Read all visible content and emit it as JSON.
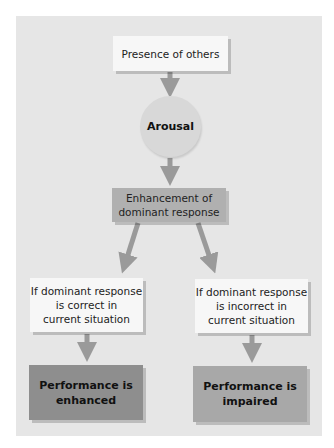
{
  "diagram": {
    "colors": {
      "panel_bg": "#e6e6e6",
      "arrow": "#9a9a9a",
      "light_box": "#f7f7f7",
      "circle": "#d8d8d8",
      "mid_box": "#b0b0b0",
      "result_enhanced": "#8e8e8e",
      "result_impaired": "#a8a8a8"
    },
    "nodes": {
      "presence": {
        "label": "Presence of others"
      },
      "arousal": {
        "label": "Arousal"
      },
      "enhancement": {
        "line1": "Enhancement of",
        "line2": "dominant response"
      },
      "condition_correct": {
        "line1": "If dominant response",
        "line2": "is correct in",
        "line3": "current situation"
      },
      "condition_incorrect": {
        "line1": "If dominant response",
        "line2": "is incorrect in",
        "line3": "current situation"
      },
      "result_enhanced": {
        "line1": "Performance is",
        "line2": "enhanced"
      },
      "result_impaired": {
        "line1": "Performance is",
        "line2": "impaired"
      }
    },
    "edges": [
      {
        "from": "presence",
        "to": "arousal"
      },
      {
        "from": "arousal",
        "to": "enhancement"
      },
      {
        "from": "enhancement",
        "to": "condition_correct"
      },
      {
        "from": "enhancement",
        "to": "condition_incorrect"
      },
      {
        "from": "condition_correct",
        "to": "result_enhanced"
      },
      {
        "from": "condition_incorrect",
        "to": "result_impaired"
      }
    ]
  }
}
